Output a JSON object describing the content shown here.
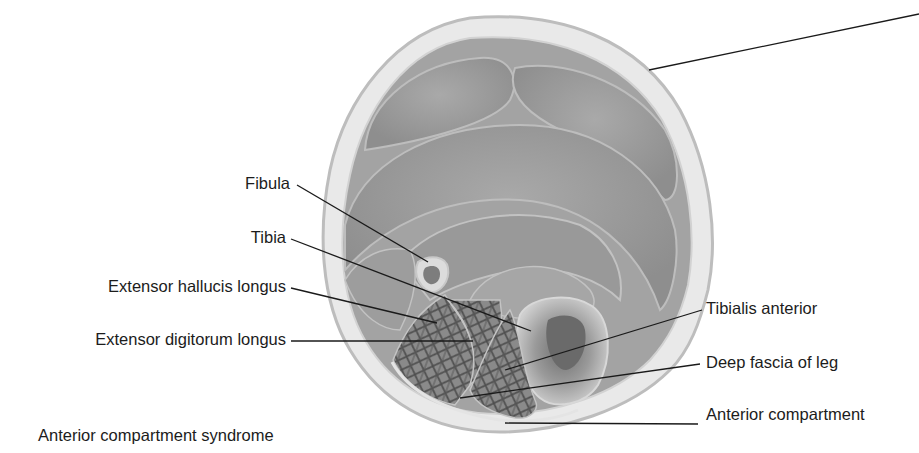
{
  "figure": {
    "caption": "Anterior compartment syndrome",
    "colors": {
      "background": "#ffffff",
      "skin_outline": "#c9c9c9",
      "subcutaneous_fat": "#e6e6e6",
      "muscle": "#9e9e9e",
      "muscle_dark": "#7a7a7a",
      "compartment_fiber": "#555555",
      "leader_line": "#1a1a1a",
      "text": "#1c1c1c"
    }
  },
  "labels": {
    "left": [
      {
        "id": "fibula",
        "text": "Fibula"
      },
      {
        "id": "tibia",
        "text": "Tibia"
      },
      {
        "id": "extensor-hallucis-longus",
        "text": "Extensor hallucis longus"
      },
      {
        "id": "extensor-digitorum-longus",
        "text": "Extensor digitorum longus"
      }
    ],
    "right": [
      {
        "id": "tibialis-anterior",
        "text": "Tibialis anterior"
      },
      {
        "id": "deep-fascia-of-leg",
        "text": "Deep fascia of leg"
      },
      {
        "id": "anterior-compartment",
        "text": "Anterior compartment"
      }
    ],
    "top_right_unlabeled_leader": ""
  }
}
